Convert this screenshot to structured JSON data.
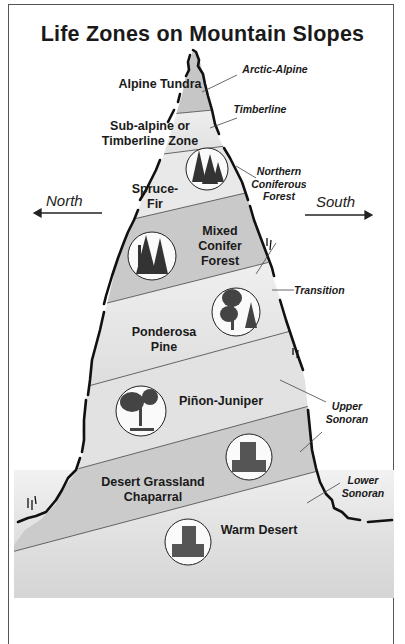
{
  "title": "Life Zones on Mountain Slopes",
  "directions": {
    "left": "North",
    "right": "South"
  },
  "zones": [
    {
      "id": "alpine-tundra",
      "label": "Alpine Tundra",
      "fill": "#c6c6c6"
    },
    {
      "id": "subalpine",
      "label_line1": "Sub-alpine or",
      "label_line2": "Timberline Zone",
      "fill": "#e6e6e6"
    },
    {
      "id": "spruce-fir",
      "label_line1": "Spruce-",
      "label_line2": "Fir",
      "fill": "#e8e8e8"
    },
    {
      "id": "mixed-conifer",
      "label_line1": "Mixed",
      "label_line2": "Conifer",
      "label_line3": "Forest",
      "fill": "#c8c8c8"
    },
    {
      "id": "ponderosa-pine",
      "label_line1": "Ponderosa",
      "label_line2": "Pine",
      "fill": "#ebebeb"
    },
    {
      "id": "pinon-juniper",
      "label": "Piñon-Juniper",
      "fill": "#e2e2e2"
    },
    {
      "id": "desert-grassland",
      "label_line1": "Desert Grassland",
      "label_line2": "Chaparral",
      "fill": "#cbcbcb"
    },
    {
      "id": "warm-desert",
      "label": "Warm Desert",
      "fill": "#e4e4e4"
    }
  ],
  "side_labels": {
    "arctic_alpine": "Arctic-Alpine",
    "timberline": "Timberline",
    "northern_coniferous_1": "Northern",
    "northern_coniferous_2": "Coniferous",
    "northern_coniferous_3": "Forest",
    "transition": "Transition",
    "upper_sonoran_1": "Upper",
    "upper_sonoran_2": "Sonoran",
    "lower_sonoran_1": "Lower",
    "lower_sonoran_2": "Sonoran"
  },
  "illustrations": [
    {
      "zone": "spruce-fir",
      "icon": "spruce-trees-icon"
    },
    {
      "zone": "mixed-conifer",
      "icon": "conifer-trees-icon"
    },
    {
      "zone": "ponderosa-pine",
      "icon": "ponderosa-tree-icon"
    },
    {
      "zone": "pinon-juniper",
      "icon": "pinon-tree-icon"
    },
    {
      "zone": "desert-grassland",
      "icon": "rock-grassland-icon"
    },
    {
      "zone": "warm-desert",
      "icon": "desert-rock-icon"
    }
  ]
}
